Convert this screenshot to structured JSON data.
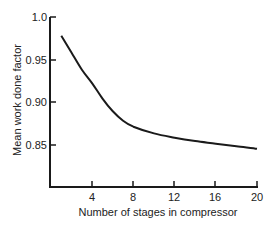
{
  "chart_data": {
    "type": "line",
    "title": "",
    "xlabel": "Number of stages in compressor",
    "ylabel": "Mean work done factor",
    "xlim": [
      0,
      20
    ],
    "ylim": [
      0.8,
      1.0
    ],
    "x_ticks": [
      "4",
      "8",
      "12",
      "16",
      "20"
    ],
    "y_ticks": [
      "1.0",
      "0.95",
      "0.90",
      "0.85"
    ],
    "grid": false,
    "legend": null,
    "series": [
      {
        "name": "Mean work done factor",
        "x": [
          1,
          2,
          3,
          4,
          5,
          6,
          7,
          8,
          10,
          12,
          14,
          16,
          18,
          20
        ],
        "values": [
          0.978,
          0.958,
          0.938,
          0.922,
          0.904,
          0.889,
          0.878,
          0.871,
          0.863,
          0.858,
          0.854,
          0.851,
          0.848,
          0.845
        ]
      }
    ]
  }
}
